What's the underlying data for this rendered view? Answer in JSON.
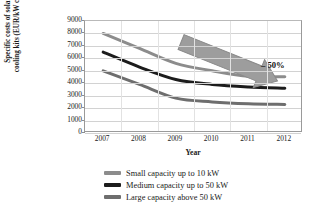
{
  "chart_data": {
    "type": "line",
    "title": "",
    "xlabel": "Year",
    "ylabel": "Specific costs of solar cooling kits (EUR/kW cold)",
    "ylabel_line1": "Specific costs of solar",
    "ylabel_line2": "cooling kits (EUR/kW cold)",
    "categories": [
      "2007",
      "2008",
      "2009",
      "2010",
      "2011",
      "2012"
    ],
    "x": [
      2007,
      2008,
      2009,
      2010,
      2011,
      2012
    ],
    "ylim": [
      0,
      9000
    ],
    "yticks": [
      9000,
      8000,
      7000,
      6000,
      5000,
      4000,
      3000,
      2000,
      1000,
      0
    ],
    "grid": true,
    "legend_position": "below",
    "series": [
      {
        "name": "Small capacity up to 10 kW",
        "color": "#8c8c8c",
        "values": [
          8000,
          6800,
          5600,
          5000,
          4550,
          4520
        ]
      },
      {
        "name": "Medium capacity up to 50 kW",
        "color": "#1c1c1c",
        "values": [
          6500,
          5300,
          4300,
          3900,
          3700,
          3600
        ]
      },
      {
        "name": "Large capacity above 50 kW",
        "color": "#6e6e6e",
        "values": [
          5000,
          3900,
          2800,
          2500,
          2350,
          2300
        ]
      }
    ],
    "annotations": [
      {
        "name": "reduction-arrow",
        "label": "– 50%",
        "shape": "block-arrow",
        "direction": "down-right",
        "color": "#9a9a9a"
      }
    ]
  },
  "legend": {
    "items": [
      {
        "label": "Small capacity up to 10 kW",
        "color": "#8c8c8c"
      },
      {
        "label": "Medium capacity up to 50 kW",
        "color": "#1c1c1c"
      },
      {
        "label": "Large capacity above 50 kW",
        "color": "#6e6e6e"
      }
    ]
  },
  "axes": {
    "y_ticks": [
      "9000",
      "8000",
      "7000",
      "6000",
      "5000",
      "4000",
      "3000",
      "2000",
      "1000",
      "0"
    ],
    "x_ticks": [
      "2007",
      "2008",
      "2009",
      "2010",
      "2011",
      "2012"
    ],
    "x_title": "Year"
  }
}
